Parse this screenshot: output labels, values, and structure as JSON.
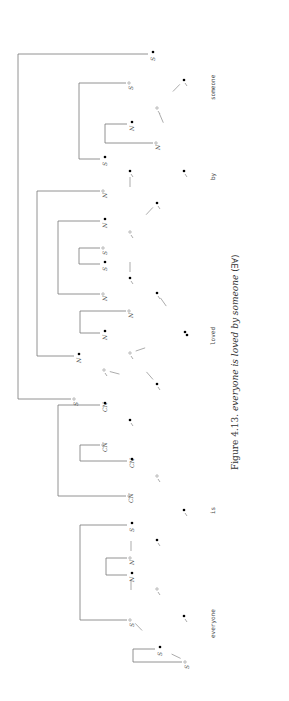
{
  "figure": {
    "caption_prefix": "Figure 4.13.",
    "caption_sentence": "everyone is loved by someone",
    "caption_reading": "(∃∀)",
    "orientation": "rotated-90-ccw"
  },
  "words": [
    {
      "id": "w1",
      "text": "someone"
    },
    {
      "id": "w2",
      "text": "by"
    },
    {
      "id": "w3",
      "text": "loved"
    },
    {
      "id": "w4",
      "text": "is"
    },
    {
      "id": "w5",
      "text": "everyone"
    }
  ],
  "symbols": {
    "filled_dot": "•",
    "open_dot": "∘",
    "positive_S": "S•",
    "negative_S": "S°",
    "positive_N": "N•",
    "negative_N": "N°",
    "positive_CN": "CN•",
    "negative_CN": "CN°"
  },
  "leaves": [
    {
      "label": "S",
      "pol": "•",
      "x": 152,
      "y": 53
    },
    {
      "label": "S",
      "pol": "°",
      "x": 130,
      "y": 82
    },
    {
      "label": "N",
      "pol": "•",
      "x": 131,
      "y": 123
    },
    {
      "label": "N",
      "pol": "°",
      "x": 157,
      "y": 142
    },
    {
      "label": "S",
      "pol": "•",
      "x": 104,
      "y": 158
    },
    {
      "label": "N",
      "pol": "°",
      "x": 104,
      "y": 190
    },
    {
      "label": "N",
      "pol": "•",
      "x": 104,
      "y": 220
    },
    {
      "label": "S",
      "pol": "°",
      "x": 104,
      "y": 247
    },
    {
      "label": "S",
      "pol": "•",
      "x": 104,
      "y": 263
    },
    {
      "label": "N",
      "pol": "°",
      "x": 104,
      "y": 293
    },
    {
      "label": "N",
      "pol": "°",
      "x": 130,
      "y": 310
    },
    {
      "label": "N",
      "pol": "•",
      "x": 104,
      "y": 332
    },
    {
      "label": "N",
      "pol": "•",
      "x": 78,
      "y": 355
    },
    {
      "label": "S",
      "pol": "°",
      "x": 75,
      "y": 398
    },
    {
      "label": "CN",
      "pol": "•",
      "x": 104,
      "y": 404
    },
    {
      "label": "CN",
      "pol": "°",
      "x": 104,
      "y": 444
    },
    {
      "label": "CN",
      "pol": "•",
      "x": 131,
      "y": 460
    },
    {
      "label": "CN",
      "pol": "°",
      "x": 130,
      "y": 495
    },
    {
      "label": "S",
      "pol": "•",
      "x": 131,
      "y": 524
    },
    {
      "label": "N",
      "pol": "°",
      "x": 131,
      "y": 557
    },
    {
      "label": "N",
      "pol": "•",
      "x": 131,
      "y": 574
    },
    {
      "label": "S",
      "pol": "°",
      "x": 131,
      "y": 619
    },
    {
      "label": "S",
      "pol": "•",
      "x": 159,
      "y": 648
    },
    {
      "label": "S",
      "pol": "°",
      "x": 186,
      "y": 661
    }
  ],
  "axioms": [
    {
      "from": 0,
      "to": 13,
      "bx": 18
    },
    {
      "from": 1,
      "to": 4,
      "bx": 79
    },
    {
      "from": 2,
      "to": 3,
      "bx": 105
    },
    {
      "from": 5,
      "to": 12,
      "bx": 37
    },
    {
      "from": 6,
      "to": 9,
      "bx": 58
    },
    {
      "from": 7,
      "to": 8,
      "bx": 79
    },
    {
      "from": 10,
      "to": 11,
      "bx": 80
    },
    {
      "from": 14,
      "to": 17,
      "bx": 58
    },
    {
      "from": 15,
      "to": 16,
      "bx": 80
    },
    {
      "from": 18,
      "to": 21,
      "bx": 80
    },
    {
      "from": 19,
      "to": 20,
      "bx": 106
    },
    {
      "from": 22,
      "to": 23,
      "bx": 133
    }
  ],
  "links": [
    {
      "x": 184,
      "y": 80,
      "pol": "•"
    },
    {
      "x": 157,
      "y": 108,
      "pol": "°"
    },
    {
      "x": 184,
      "y": 171,
      "pol": "•"
    },
    {
      "x": 130,
      "y": 171,
      "pol": "•"
    },
    {
      "x": 157,
      "y": 203,
      "pol": "•"
    },
    {
      "x": 130,
      "y": 232,
      "pol": "°"
    },
    {
      "x": 130,
      "y": 278,
      "pol": "•"
    },
    {
      "x": 157,
      "y": 293,
      "pol": "•"
    },
    {
      "x": 186,
      "y": 334,
      "pol": "••"
    },
    {
      "x": 104,
      "y": 370,
      "pol": "°"
    },
    {
      "x": 130,
      "y": 353,
      "pol": "°"
    },
    {
      "x": 157,
      "y": 384,
      "pol": "•"
    },
    {
      "x": 130,
      "y": 420,
      "pol": "•"
    },
    {
      "x": 157,
      "y": 476,
      "pol": "°"
    },
    {
      "x": 184,
      "y": 510,
      "pol": "•"
    },
    {
      "x": 157,
      "y": 540,
      "pol": "•"
    },
    {
      "x": 157,
      "y": 589,
      "pol": "°"
    },
    {
      "x": 184,
      "y": 616,
      "pol": "•"
    }
  ]
}
